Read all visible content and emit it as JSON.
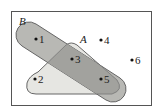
{
  "diagram": {
    "type": "venn",
    "universe": {
      "name": "universe",
      "elements": [
        "1",
        "2",
        "3",
        "4",
        "5",
        "6"
      ]
    },
    "sets": [
      {
        "name": "A",
        "label": "A",
        "elements": [
          "2",
          "3",
          "5"
        ],
        "fill": "#e6e6e2"
      },
      {
        "name": "B",
        "label": "B",
        "elements": [
          "1",
          "3",
          "5"
        ],
        "fill": "#b8b8b4"
      }
    ],
    "intersection_fill": "#a2a29e",
    "points": [
      {
        "label": "1",
        "region": "B only"
      },
      {
        "label": "2",
        "region": "A only"
      },
      {
        "label": "3",
        "region": "A and B"
      },
      {
        "label": "4",
        "region": "outside"
      },
      {
        "label": "5",
        "region": "A and B"
      },
      {
        "label": "6",
        "region": "outside"
      }
    ],
    "colors": {
      "border": "#555555",
      "dot": "#111111"
    }
  }
}
